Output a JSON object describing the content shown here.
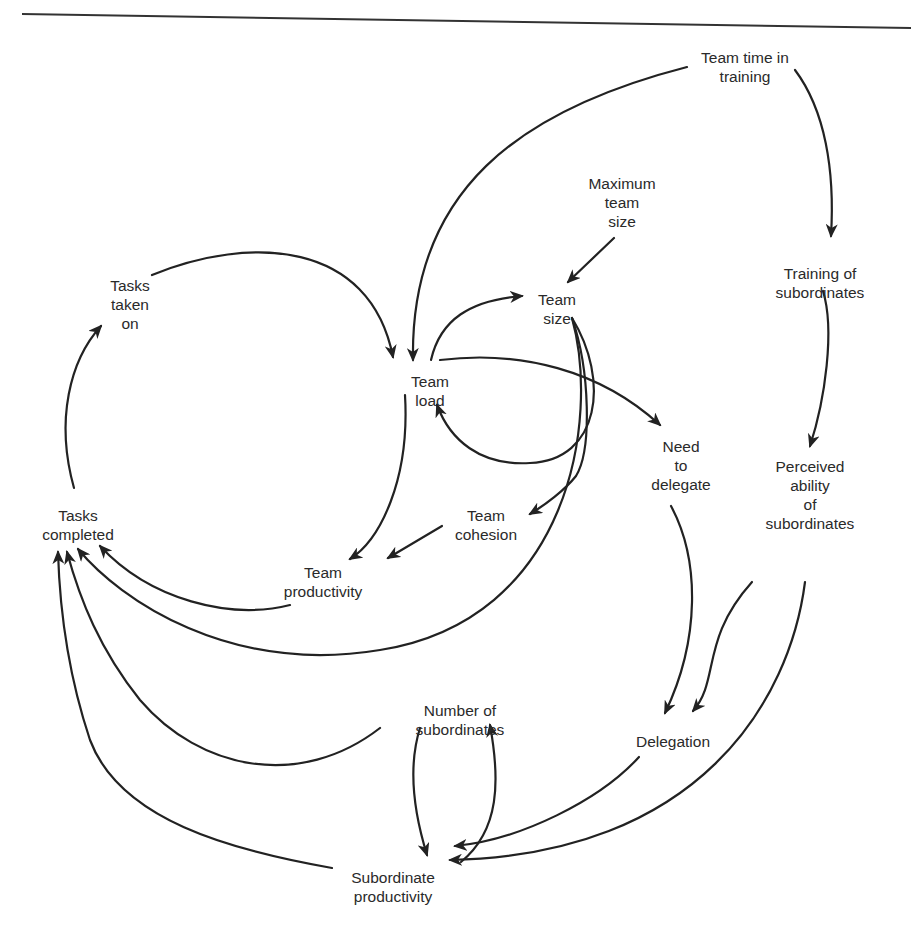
{
  "diagram": {
    "type": "causal-loop",
    "stroke_color": "#222222",
    "text_color": "#2a2a2a",
    "nodes": [
      {
        "id": "team_time_training",
        "label": "Team time in\ntraining",
        "x": 745,
        "y": 48
      },
      {
        "id": "max_team_size",
        "label": "Maximum\nteam\nsize",
        "x": 622,
        "y": 174
      },
      {
        "id": "training_subordinates",
        "label": "Training of\nsubordinates",
        "x": 820,
        "y": 264
      },
      {
        "id": "tasks_taken_on",
        "label": "Tasks\ntaken\non",
        "x": 130,
        "y": 276
      },
      {
        "id": "team_size",
        "label": "Team\nsize",
        "x": 557,
        "y": 290
      },
      {
        "id": "team_load",
        "label": "Team\nload",
        "x": 430,
        "y": 372
      },
      {
        "id": "need_to_delegate",
        "label": "Need\nto\ndelegate",
        "x": 681,
        "y": 437
      },
      {
        "id": "perceived_ability",
        "label": "Perceived\nability\nof\nsubordinates",
        "x": 810,
        "y": 457
      },
      {
        "id": "tasks_completed",
        "label": "Tasks\ncompleted",
        "x": 78,
        "y": 506
      },
      {
        "id": "team_cohesion",
        "label": "Team\ncohesion",
        "x": 486,
        "y": 506
      },
      {
        "id": "team_productivity",
        "label": "Team\nproductivity",
        "x": 323,
        "y": 563
      },
      {
        "id": "number_subordinates",
        "label": "Number of\nsubordinates",
        "x": 460,
        "y": 701
      },
      {
        "id": "delegation",
        "label": "Delegation",
        "x": 673,
        "y": 732
      },
      {
        "id": "subordinate_productivity",
        "label": "Subordinate\nproductivity",
        "x": 393,
        "y": 868
      }
    ],
    "edges": [
      {
        "from": "team_time_training",
        "to": "team_load",
        "d": "M 687 67 C 520 110, 410 190, 413 360"
      },
      {
        "from": "team_time_training",
        "to": "training_subordinates",
        "d": "M 795 70 C 825 110, 835 170, 831 236"
      },
      {
        "from": "max_team_size",
        "to": "team_size",
        "d": "M 614 238 L 568 282"
      },
      {
        "from": "tasks_taken_on",
        "to": "team_load",
        "d": "M 152 275 C 250 235, 370 240, 393 357"
      },
      {
        "from": "team_load",
        "to": "team_size",
        "d": "M 431 360 C 440 320, 470 300, 522 296"
      },
      {
        "from": "team_size",
        "to": "team_load",
        "d": "M 572 318 C 610 380, 600 460, 530 463 C 480 466, 450 440, 437 405"
      },
      {
        "from": "team_size",
        "to": "team_cohesion",
        "d": "M 572 318 C 590 370, 592 450, 576 476 C 565 490, 545 505, 530 514"
      },
      {
        "from": "team_size",
        "to": "tasks_completed",
        "d": "M 572 318 C 600 420, 570 620, 380 650 C 230 675, 120 600, 78 549"
      },
      {
        "from": "team_load",
        "to": "need_to_delegate",
        "d": "M 440 360 C 520 350, 600 370, 660 425"
      },
      {
        "from": "team_load",
        "to": "team_productivity",
        "d": "M 405 395 C 410 480, 380 540, 350 559"
      },
      {
        "from": "team_cohesion",
        "to": "team_productivity",
        "d": "M 442 526 L 388 558"
      },
      {
        "from": "team_productivity",
        "to": "tasks_completed",
        "d": "M 290 605 C 230 620, 150 600, 100 546"
      },
      {
        "from": "tasks_completed",
        "to": "tasks_taken_on",
        "d": "M 74 488 C 55 420, 70 360, 101 326"
      },
      {
        "from": "training_subordinates",
        "to": "perceived_ability",
        "d": "M 823 291 C 835 330, 825 400, 810 446"
      },
      {
        "from": "need_to_delegate",
        "to": "delegation",
        "d": "M 671 506 C 700 560, 700 640, 665 713"
      },
      {
        "from": "perceived_ability",
        "to": "delegation",
        "d": "M 752 582 C 700 640, 720 680, 693 711"
      },
      {
        "from": "perceived_ability",
        "to": "subordinate_productivity",
        "d": "M 805 582 C 790 700, 700 855, 450 860"
      },
      {
        "from": "delegation",
        "to": "subordinate_productivity",
        "d": "M 639 757 C 600 800, 520 840, 455 846"
      },
      {
        "from": "number_subordinates",
        "to": "subordinate_productivity",
        "d": "M 420 728 C 410 760, 410 800, 427 855"
      },
      {
        "from": "subordinate_productivity",
        "to": "number_subordinates",
        "d": "M 461 862 C 500 830, 500 780, 490 725"
      },
      {
        "from": "number_subordinates",
        "to": "tasks_completed",
        "d": "M 380 728 C 300 790, 200 770, 140 700 C 100 650, 80 600, 67 552"
      },
      {
        "from": "subordinate_productivity",
        "to": "tasks_completed",
        "d": "M 332 868 C 230 850, 120 820, 90 740 C 70 680, 60 620, 58 552"
      }
    ]
  }
}
